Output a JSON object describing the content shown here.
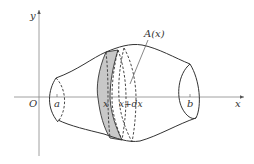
{
  "figure": {
    "labels": {
      "y_axis": "y",
      "x_axis": "x",
      "origin": "O",
      "a": "a",
      "b": "b",
      "x": "x",
      "x_plus_dx": "x+dx",
      "area": "A(x)"
    },
    "colors": {
      "line": "#333333",
      "axis": "#888888",
      "slice_fill": "#c8c8c8",
      "background": "#ffffff"
    }
  }
}
